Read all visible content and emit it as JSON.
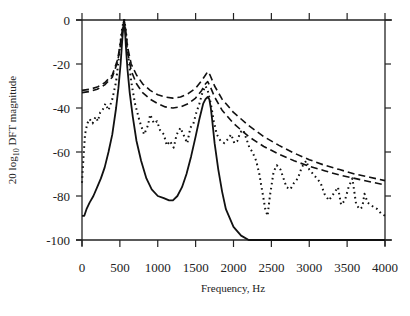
{
  "chart_data": {
    "type": "line",
    "title": "",
    "xlabel": "Frequency, Hz",
    "ylabel_prefix": "20 log",
    "ylabel_sub": "10",
    "ylabel_suffix": " DFT magnitude",
    "xlim": [
      0,
      4000
    ],
    "ylim": [
      -100,
      0
    ],
    "x_ticks": [
      0,
      500,
      1000,
      1500,
      2000,
      2500,
      3000,
      3500,
      4000
    ],
    "y_ticks": [
      0,
      -20,
      -40,
      -60,
      -80,
      -100
    ],
    "grid": false,
    "legend": null,
    "series": [
      {
        "name": "solid",
        "style": "solid",
        "x": [
          0,
          30,
          60,
          100,
          150,
          200,
          250,
          300,
          350,
          400,
          450,
          480,
          510,
          530,
          545,
          555,
          565,
          580,
          600,
          630,
          670,
          720,
          780,
          850,
          920,
          1000,
          1080,
          1150,
          1200,
          1260,
          1320,
          1380,
          1440,
          1500,
          1550,
          1600,
          1630,
          1660,
          1680,
          1700,
          1720,
          1750,
          1800,
          1850,
          1900,
          2000,
          2100,
          2200,
          2300,
          2380,
          2420,
          4000
        ],
        "y": [
          -89,
          -89,
          -86,
          -83,
          -80,
          -76,
          -72,
          -67,
          -60,
          -52,
          -40,
          -31,
          -20,
          -10,
          -3,
          0,
          -3,
          -12,
          -22,
          -33,
          -44,
          -55,
          -64,
          -72,
          -77,
          -80,
          -81,
          -82,
          -82,
          -80,
          -76,
          -70,
          -62,
          -53,
          -45,
          -38,
          -36,
          -35,
          -36,
          -40,
          -46,
          -56,
          -68,
          -78,
          -86,
          -94,
          -98,
          -100,
          -100,
          -100,
          -100,
          -100
        ]
      },
      {
        "name": "dashed-upper",
        "style": "dashed",
        "x": [
          0,
          100,
          200,
          300,
          400,
          470,
          510,
          540,
          555,
          570,
          600,
          650,
          720,
          800,
          900,
          1000,
          1100,
          1200,
          1300,
          1400,
          1500,
          1580,
          1630,
          1660,
          1690,
          1750,
          1850,
          2000,
          2200,
          2400,
          2600,
          2800,
          3000,
          3200,
          3400,
          3600,
          3800,
          4000
        ],
        "y": [
          -32,
          -31.5,
          -30.5,
          -28.5,
          -25,
          -18,
          -10,
          -3,
          0,
          -3,
          -12,
          -20,
          -25,
          -29,
          -32,
          -34,
          -35,
          -35.5,
          -35,
          -33.5,
          -31,
          -27.5,
          -25,
          -23.5,
          -25,
          -30,
          -36,
          -42,
          -48,
          -53,
          -57,
          -60.5,
          -63.5,
          -66,
          -68,
          -70,
          -71.5,
          -73
        ]
      },
      {
        "name": "dashed-lower",
        "style": "dashed",
        "x": [
          0,
          100,
          200,
          300,
          400,
          470,
          510,
          540,
          555,
          570,
          600,
          650,
          720,
          800,
          900,
          1000,
          1100,
          1200,
          1300,
          1400,
          1500,
          1580,
          1630,
          1660,
          1690,
          1750,
          1850,
          2000,
          2200,
          2400,
          2600,
          2800,
          3000,
          3200,
          3400,
          3600,
          3800,
          4000
        ],
        "y": [
          -33,
          -32.5,
          -31.5,
          -29.5,
          -26,
          -19,
          -11,
          -4,
          -1,
          -4,
          -14,
          -23,
          -29,
          -33,
          -36,
          -38,
          -39.5,
          -40,
          -39.5,
          -38,
          -35.5,
          -32,
          -29,
          -28,
          -30,
          -35,
          -41,
          -47,
          -53,
          -57.5,
          -61,
          -64,
          -66.5,
          -68.5,
          -70.5,
          -72,
          -73.5,
          -75
        ]
      },
      {
        "name": "dotted",
        "style": "dotted",
        "x": [
          0,
          20,
          40,
          70,
          100,
          140,
          180,
          210,
          240,
          270,
          310,
          350,
          400,
          450,
          490,
          520,
          545,
          560,
          580,
          610,
          650,
          700,
          760,
          820,
          870,
          900,
          950,
          990,
          1030,
          1080,
          1120,
          1160,
          1210,
          1250,
          1300,
          1350,
          1390,
          1430,
          1470,
          1510,
          1550,
          1590,
          1630,
          1660,
          1700,
          1740,
          1780,
          1830,
          1880,
          1930,
          1970,
          2010,
          2050,
          2090,
          2130,
          2170,
          2210,
          2250,
          2300,
          2340,
          2380,
          2420,
          2450,
          2480,
          2530,
          2570,
          2620,
          2660,
          2700,
          2750,
          2800,
          2850,
          2900,
          2960,
          3000,
          3050,
          3100,
          3150,
          3200,
          3260,
          3300,
          3340,
          3380,
          3420,
          3470,
          3520,
          3570,
          3620,
          3670,
          3700,
          3730,
          3770,
          3810,
          3850,
          3900,
          3950,
          4000
        ],
        "y": [
          -74,
          -62,
          -52,
          -47,
          -45,
          -47,
          -44,
          -46,
          -42,
          -41,
          -38,
          -41,
          -36,
          -28,
          -16,
          -6,
          -1,
          0,
          -5,
          -16,
          -28,
          -38,
          -46,
          -52,
          -48,
          -43,
          -47,
          -46,
          -50,
          -52,
          -57,
          -55,
          -58,
          -52,
          -49,
          -53,
          -56,
          -49,
          -47,
          -42,
          -38,
          -33,
          -30,
          -32,
          -38,
          -46,
          -52,
          -55,
          -56,
          -54,
          -52,
          -56,
          -55,
          -51,
          -50,
          -54,
          -58,
          -60,
          -64,
          -70,
          -78,
          -86,
          -89,
          -80,
          -69,
          -66,
          -68,
          -72,
          -76,
          -77,
          -74,
          -72,
          -67,
          -64,
          -68,
          -70,
          -72,
          -74,
          -79,
          -82,
          -80,
          -78,
          -76,
          -84,
          -82,
          -76,
          -72,
          -84,
          -86,
          -85,
          -79,
          -83,
          -84,
          -85,
          -86,
          -88,
          -89
        ]
      }
    ]
  }
}
